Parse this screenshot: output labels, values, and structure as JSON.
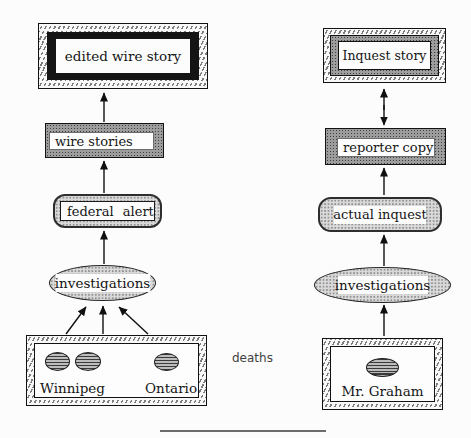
{
  "diagram": {
    "colors": {
      "ink": "#111111",
      "dark_stipple_fill": "#9d9d9d",
      "light_stipple_fill": "#d9d9d9",
      "black_band": "#141414",
      "paper": "#fcfcfc"
    },
    "nodes": {
      "edited_wire_story": "edited wire story",
      "wire_stories": "wire stories",
      "federal_alert": "federal alert",
      "investigations_left": "investigations",
      "winnipeg": "Winnipeg",
      "ontario": "Ontario",
      "deaths_annotation": "deaths",
      "inquest_story": "Inquest story",
      "reporter_copy": "reporter copy",
      "actual_inquest": "actual inquest",
      "investigations_right": "investigations",
      "mr_graham": "Mr. Graham"
    }
  }
}
